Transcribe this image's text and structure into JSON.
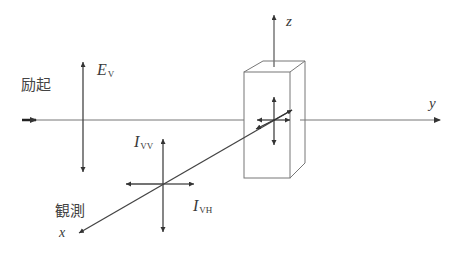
{
  "diagram": {
    "title": "",
    "labels": {
      "excitation": "励起",
      "observation": "観測",
      "ev_main": "E",
      "ev_sub": "V",
      "ivv_main": "I",
      "ivv_sub": "VV",
      "ivh_main": "I",
      "ivh_sub": "VH",
      "axis_x": "x",
      "axis_y": "y",
      "axis_z": "z"
    },
    "colors": {
      "line": "#444444",
      "thin_line": "#777777",
      "background": "#ffffff"
    }
  }
}
